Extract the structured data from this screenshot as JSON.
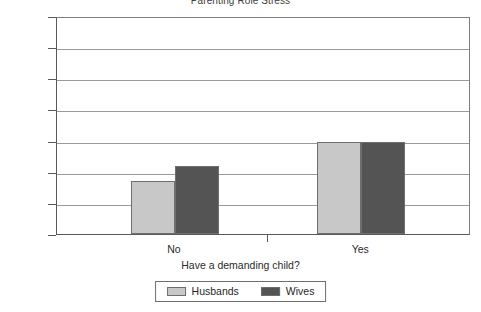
{
  "chart_data": {
    "type": "bar",
    "title": "Parenting Role Stress",
    "xlabel": "Have a demanding child?",
    "ylabel": "",
    "categories": [
      "No",
      "Yes"
    ],
    "series": [
      {
        "name": "Husbands",
        "values": [
          102,
          127
        ],
        "color": "#c8c8c8"
      },
      {
        "name": "Wives",
        "values": [
          112,
          127
        ],
        "color": "#545454"
      }
    ],
    "ylim": [
      68,
      208
    ],
    "y_ticks": [
      68,
      88,
      108,
      128,
      148,
      168,
      188,
      208
    ],
    "y_tick_labels": [
      "68",
      "88",
      "108",
      "128",
      "148",
      "168",
      "188",
      "208"
    ],
    "grid": true,
    "legend_position": "bottom"
  },
  "legend": {
    "entries": [
      {
        "label": "Husbands"
      },
      {
        "label": "Wives"
      }
    ]
  },
  "axis": {
    "x_categories": [
      "No",
      "Yes"
    ],
    "x_title": "Have a demanding child?"
  }
}
